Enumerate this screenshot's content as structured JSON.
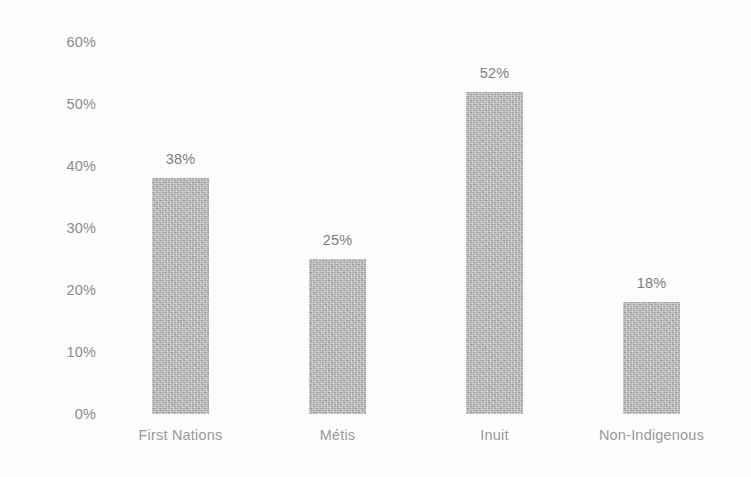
{
  "chart_data": {
    "type": "bar",
    "title": "",
    "subtitle": "",
    "xlabel": "",
    "ylabel": "",
    "categories": [
      "First Nations",
      "Métis",
      "Inuit",
      "Non-Indigenous"
    ],
    "values": [
      38,
      25,
      52,
      18
    ],
    "value_labels": [
      "38%",
      "25%",
      "52%",
      "18%"
    ],
    "ylim": [
      0,
      60
    ],
    "ytick_values": [
      0,
      10,
      20,
      30,
      40,
      50,
      60
    ],
    "ytick_labels": [
      "0%",
      "10%",
      "20%",
      "30%",
      "40%",
      "50%",
      "60%"
    ],
    "grid": false,
    "legend": false,
    "legend_position": "none",
    "bar_color": "#b6b6b6",
    "text_color": "#8d8d8d",
    "background_color": "#fefefe"
  }
}
